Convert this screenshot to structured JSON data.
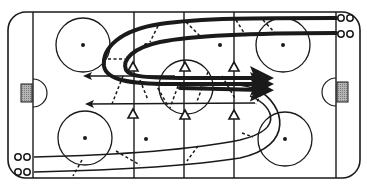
{
  "diagram": {
    "type": "hockey-drill",
    "colors": {
      "line": "#1a1a1a",
      "background": "#ffffff",
      "net": "#9a9a9a"
    },
    "rink": {
      "x": 8,
      "y": 12,
      "width": 352,
      "height": 166,
      "corner_radius": 18
    },
    "goal_lines": [
      33,
      336
    ],
    "vertical_lines": [
      134,
      184,
      234
    ],
    "faceoff_circles": [
      {
        "id": "left-top",
        "cx": 83,
        "cy": 45,
        "r": 27
      },
      {
        "id": "left-bottom",
        "cx": 85,
        "cy": 138,
        "r": 27
      },
      {
        "id": "right-top",
        "cx": 283,
        "cy": 45,
        "r": 27
      },
      {
        "id": "right-bottom",
        "cx": 285,
        "cy": 139,
        "r": 27
      },
      {
        "id": "center",
        "cx": 186,
        "cy": 87,
        "r": 27
      }
    ],
    "faceoff_dots": [
      {
        "cx": 83,
        "cy": 45
      },
      {
        "cx": 85,
        "cy": 138
      },
      {
        "cx": 283,
        "cy": 45
      },
      {
        "cx": 285,
        "cy": 139
      },
      {
        "cx": 146,
        "cy": 139
      },
      {
        "cx": 220,
        "cy": 45
      },
      {
        "cx": 146,
        "cy": 45
      },
      {
        "cx": 186,
        "cy": 87
      }
    ],
    "nets": [
      {
        "id": "left-net",
        "x": 21,
        "y": 84,
        "w": 11,
        "h": 18
      },
      {
        "id": "right-net",
        "x": 336,
        "y": 82,
        "w": 11,
        "h": 20
      }
    ],
    "creases": [
      {
        "id": "left-crease",
        "cx": 33,
        "cy": 93,
        "r": 15,
        "side": "right"
      },
      {
        "id": "right-crease",
        "cx": 336,
        "cy": 92,
        "r": 15,
        "side": "left"
      }
    ],
    "pylons": [
      {
        "x": 133,
        "y": 67
      },
      {
        "x": 184,
        "y": 67
      },
      {
        "x": 234,
        "y": 67
      },
      {
        "x": 133,
        "y": 114
      },
      {
        "x": 184,
        "y": 115
      },
      {
        "x": 234,
        "y": 115
      }
    ],
    "puck_groups": [
      {
        "id": "top-right-row1",
        "x": 340,
        "y": 18
      },
      {
        "id": "top-right-row2",
        "x": 340,
        "y": 33
      },
      {
        "id": "bottom-left-row1",
        "x": 18,
        "y": 157
      },
      {
        "id": "bottom-left-row2",
        "x": 18,
        "y": 172
      }
    ],
    "skater_paths": [
      {
        "id": "thick-path-1",
        "style": "thick",
        "arrow": "end"
      },
      {
        "id": "thick-path-2",
        "style": "thick",
        "arrow": "end"
      },
      {
        "id": "arrow-left-upper",
        "style": "thin",
        "arrow": "end"
      },
      {
        "id": "arrow-left-lower",
        "style": "thin",
        "arrow": "end"
      },
      {
        "id": "lower-path-1",
        "style": "thin",
        "arrow": "none"
      },
      {
        "id": "lower-path-2",
        "style": "thin",
        "arrow": "none"
      }
    ],
    "passes": {
      "style": "dashed",
      "count": 14
    }
  }
}
